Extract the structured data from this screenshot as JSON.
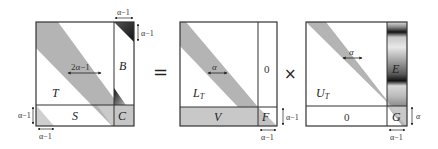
{
  "equation": {
    "operators": {
      "equals": "=",
      "times": "×"
    },
    "colors": {
      "band": "#b4b4b4",
      "band_dark": "#9a9a9a",
      "light_fill": "#d0d0d0",
      "border": "#333333",
      "background": "#ffffff"
    }
  },
  "left_matrix": {
    "blocks": {
      "T": "T",
      "B": "B",
      "S": "S",
      "C": "C"
    },
    "band_width_label": "2α−1",
    "top_right_width_label": "α−1",
    "top_right_height_label": "α−1",
    "bottom_left_height_label": "α−1",
    "bottom_left_width_label": "α−1"
  },
  "middle_matrix": {
    "blocks": {
      "L": "L",
      "L_sub": "T",
      "zero": "0",
      "V": "V",
      "F": "F"
    },
    "band_width_label": "α",
    "F_height_label": "α−1",
    "F_width_label": "α−1"
  },
  "right_matrix": {
    "blocks": {
      "U": "U",
      "U_sub": "T",
      "E": "E",
      "zero": "0",
      "G": "G"
    },
    "band_width_label": "α",
    "G_height_label": "α",
    "G_width_label": "α−1"
  }
}
